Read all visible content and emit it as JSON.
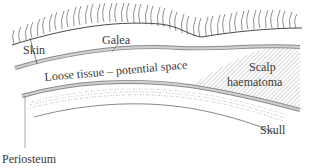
{
  "diagram": {
    "labels": {
      "skin": "Skin",
      "galea": "Galea",
      "loose_tissue": "Loose tissue – potential space",
      "scalp_haematoma_line1": "Scalp",
      "scalp_haematoma_line2": "haematoma",
      "skull": "Skull",
      "periosteum": "Periosteum"
    },
    "colors": {
      "line": "#333333",
      "band_fill": "#c8c8c8",
      "band_edge": "#8a8a8a",
      "hatch": "#9a9a9a",
      "text": "#3a3a3a"
    }
  }
}
